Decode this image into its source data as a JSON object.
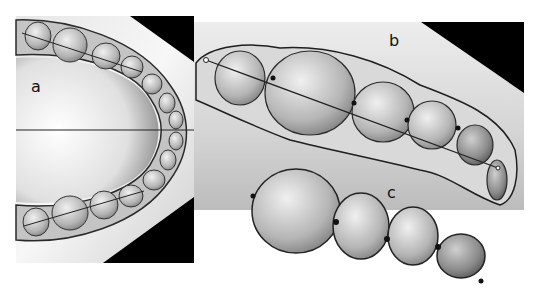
{
  "figure": {
    "panels": [
      {
        "id": "a",
        "label": "a",
        "description": "Occlusal view of full dental arch with horizontal midline and arch lines"
      },
      {
        "id": "b",
        "label": "b",
        "description": "Close-up of posterior teeth with line through contact points"
      },
      {
        "id": "c",
        "label": "c",
        "description": "Segmented individual teeth with contact point markers"
      }
    ],
    "colors": {
      "background": "#ffffff",
      "panel_gray": "#d8d8d8",
      "black_corner": "#000000",
      "tooth_fill": "#bdbdbd",
      "tooth_outline": "#333333",
      "line": "#222222"
    }
  }
}
